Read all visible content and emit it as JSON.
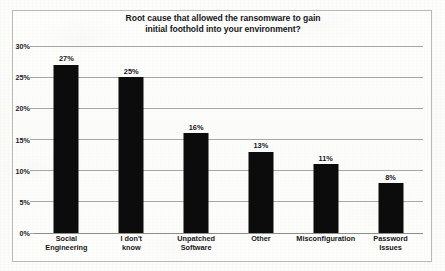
{
  "chart_data": {
    "type": "bar",
    "title": "Root cause that allowed the ransomware to gain initial foothold into your environment?",
    "title_lines": [
      "Root cause that allowed the ransomware to gain",
      "initial foothold into your environment?"
    ],
    "xlabel": "",
    "ylabel": "",
    "ylim": [
      0,
      30
    ],
    "ytick_values": [
      0,
      5,
      10,
      15,
      20,
      25,
      30
    ],
    "ytick_labels": [
      "0%",
      "5%",
      "10%",
      "15%",
      "20%",
      "25%",
      "30%"
    ],
    "grid": true,
    "legend": false,
    "categories": [
      "Social Engineering",
      "I don't know",
      "Unpatched Software",
      "Other",
      "Misconfiguration",
      "Password Issues"
    ],
    "category_lines": [
      [
        "Social",
        "Engineering"
      ],
      [
        "I don't",
        "know"
      ],
      [
        "Unpatched",
        "Software"
      ],
      [
        "Other"
      ],
      [
        "Misconfiguration"
      ],
      [
        "Password",
        "Issues"
      ]
    ],
    "values": [
      27,
      25,
      16,
      13,
      11,
      8
    ],
    "value_labels": [
      "27%",
      "25%",
      "16%",
      "13%",
      "11%",
      "8%"
    ],
    "bar_color": "#0c0c0c",
    "grid_color": "#a7a7a4",
    "text_color": "#17171a",
    "background_color": "#fcfcfb"
  }
}
